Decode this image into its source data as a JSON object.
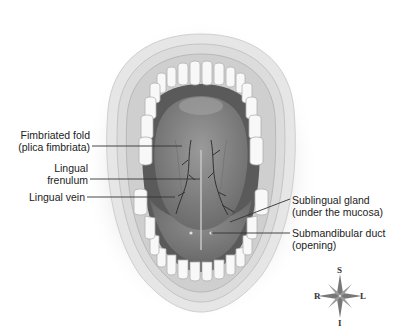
{
  "diagram": {
    "labels": [
      {
        "id": "fimbriated-fold",
        "line1": "Fimbriated fold",
        "line2": "(plica fimbriata)",
        "side": "left"
      },
      {
        "id": "lingual-frenulum",
        "line1": "Lingual",
        "line2": "frenulum",
        "side": "left"
      },
      {
        "id": "lingual-vein",
        "line1": "Lingual vein",
        "line2": "",
        "side": "left"
      },
      {
        "id": "sublingual-gland",
        "line1": "Sublingual gland",
        "line2": "(under the mucosa)",
        "side": "right"
      },
      {
        "id": "submandibular-duct",
        "line1": "Submandibular duct",
        "line2": "(opening)",
        "side": "right"
      }
    ],
    "compass": {
      "top": "S",
      "bottom": "I",
      "left": "R",
      "right": "L"
    },
    "colors": {
      "background": "#ffffff",
      "lip": "#e4e4e4",
      "gum": "#d2d2d2",
      "teeth": "#f7f7f7",
      "oral_cavity": "#5f5f5f",
      "tongue": "#8a8a8a",
      "veins": "#3a3a3a",
      "leader_line": "#333333",
      "text": "#222222"
    }
  }
}
